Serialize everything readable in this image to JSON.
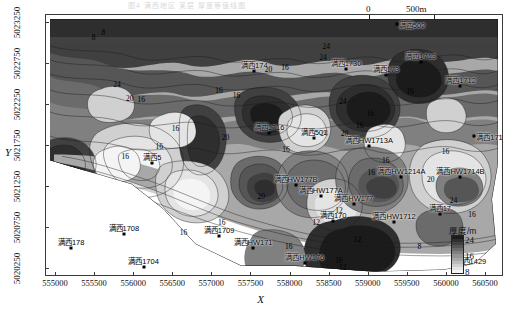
{
  "caption": "图4  满西地区 某层 厚度等值线图",
  "axes": {
    "x_title": "X",
    "y_title": "Y",
    "x_ticks": [
      "555000",
      "555500",
      "556000",
      "556500",
      "557000",
      "557500",
      "558000",
      "558500",
      "559000",
      "559500",
      "560000",
      "560500"
    ],
    "y_ticks": [
      "5020250",
      "5020750",
      "5021250",
      "5021750",
      "5022250",
      "5022750",
      "5023250"
    ]
  },
  "scalebar": {
    "start": "0",
    "end": "500m"
  },
  "legend": {
    "title": "厚度/m",
    "ticks": [
      "24",
      "16",
      "8"
    ],
    "colors": [
      "#1c1c1c",
      "#2e2e2e",
      "#414141",
      "#565656",
      "#6b6b6b",
      "#808080",
      "#949494",
      "#a8a8a8",
      "#bcbcbc",
      "#d0d0d0",
      "#e4e4e4",
      "#f4f4f4"
    ]
  },
  "wells": [
    {
      "label": "满西502",
      "x": 0.766,
      "y": 0.035,
      "anchor": "left"
    },
    {
      "label": "满西1713",
      "x": 0.818,
      "y": 0.18,
      "anchor": "top"
    },
    {
      "label": "满西1712",
      "x": 0.905,
      "y": 0.27,
      "anchor": "top"
    },
    {
      "label": "满西173",
      "x": 0.742,
      "y": 0.23,
      "anchor": "top"
    },
    {
      "label": "满西1715",
      "x": 0.935,
      "y": 0.46,
      "anchor": "left"
    },
    {
      "label": "满西HW1713A",
      "x": 0.705,
      "y": 0.5,
      "anchor": "top"
    },
    {
      "label": "满西174",
      "x": 0.455,
      "y": 0.215,
      "anchor": "top"
    },
    {
      "label": "满西1730",
      "x": 0.655,
      "y": 0.205,
      "anchor": "top"
    },
    {
      "label": "满西1716",
      "x": 0.487,
      "y": 0.45,
      "anchor": "top"
    },
    {
      "label": "满西501",
      "x": 0.585,
      "y": 0.47,
      "anchor": "top"
    },
    {
      "label": "满西5",
      "x": 0.232,
      "y": 0.565,
      "anchor": "top"
    },
    {
      "label": "满西HW177B",
      "x": 0.545,
      "y": 0.65,
      "anchor": "top"
    },
    {
      "label": "满西HW177A",
      "x": 0.6,
      "y": 0.69,
      "anchor": "top"
    },
    {
      "label": "满西HW177",
      "x": 0.672,
      "y": 0.72,
      "anchor": "top"
    },
    {
      "label": "满西170",
      "x": 0.627,
      "y": 0.785,
      "anchor": "top"
    },
    {
      "label": "满西HW1214A",
      "x": 0.776,
      "y": 0.62,
      "anchor": "top"
    },
    {
      "label": "满西HW1714B",
      "x": 0.905,
      "y": 0.62,
      "anchor": "top"
    },
    {
      "label": "满西HW1712",
      "x": 0.76,
      "y": 0.79,
      "anchor": "top"
    },
    {
      "label": "满西17",
      "x": 0.86,
      "y": 0.76,
      "anchor": "top"
    },
    {
      "label": "满西HW176",
      "x": 0.565,
      "y": 0.945,
      "anchor": "top"
    },
    {
      "label": "满西1429",
      "x": 0.89,
      "y": 0.935,
      "anchor": "left"
    },
    {
      "label": "满西HW171",
      "x": 0.452,
      "y": 0.89,
      "anchor": "top"
    },
    {
      "label": "满西1709",
      "x": 0.378,
      "y": 0.845,
      "anchor": "top"
    },
    {
      "label": "满西1708",
      "x": 0.17,
      "y": 0.835,
      "anchor": "top"
    },
    {
      "label": "满西178",
      "x": 0.055,
      "y": 0.89,
      "anchor": "top"
    },
    {
      "label": "满西1704",
      "x": 0.213,
      "y": 0.96,
      "anchor": "top"
    }
  ],
  "contour_labels": [
    {
      "text": "8",
      "x": 0.104,
      "y": 0.085
    },
    {
      "text": "8",
      "x": 0.125,
      "y": 0.065
    },
    {
      "text": "24",
      "x": 0.155,
      "y": 0.265
    },
    {
      "text": "20",
      "x": 0.183,
      "y": 0.315
    },
    {
      "text": "16",
      "x": 0.208,
      "y": 0.32
    },
    {
      "text": "16",
      "x": 0.378,
      "y": 0.285
    },
    {
      "text": "16",
      "x": 0.416,
      "y": 0.305
    },
    {
      "text": "20",
      "x": 0.486,
      "y": 0.205
    },
    {
      "text": "16",
      "x": 0.522,
      "y": 0.2
    },
    {
      "text": "24",
      "x": 0.605,
      "y": 0.16
    },
    {
      "text": "24",
      "x": 0.612,
      "y": 0.12
    },
    {
      "text": "24",
      "x": 0.648,
      "y": 0.33
    },
    {
      "text": "16",
      "x": 0.283,
      "y": 0.43
    },
    {
      "text": "16",
      "x": 0.247,
      "y": 0.5
    },
    {
      "text": "16",
      "x": 0.173,
      "y": 0.54
    },
    {
      "text": "20",
      "x": 0.392,
      "y": 0.465
    },
    {
      "text": "16",
      "x": 0.524,
      "y": 0.51
    },
    {
      "text": "24",
      "x": 0.607,
      "y": 0.45
    },
    {
      "text": "20",
      "x": 0.652,
      "y": 0.45
    },
    {
      "text": "16",
      "x": 0.708,
      "y": 0.375
    },
    {
      "text": "16",
      "x": 0.685,
      "y": 0.42
    },
    {
      "text": "20",
      "x": 0.47,
      "y": 0.69
    },
    {
      "text": "16",
      "x": 0.71,
      "y": 0.6
    },
    {
      "text": "16",
      "x": 0.742,
      "y": 0.555
    },
    {
      "text": "20",
      "x": 0.84,
      "y": 0.625
    },
    {
      "text": "12",
      "x": 0.64,
      "y": 0.745
    },
    {
      "text": "12",
      "x": 0.59,
      "y": 0.79
    },
    {
      "text": "24",
      "x": 0.89,
      "y": 0.705
    },
    {
      "text": "16",
      "x": 0.93,
      "y": 0.76
    },
    {
      "text": "16",
      "x": 0.384,
      "y": 0.79
    },
    {
      "text": "12",
      "x": 0.68,
      "y": 0.855
    },
    {
      "text": "16",
      "x": 0.3,
      "y": 0.83
    },
    {
      "text": "16",
      "x": 0.64,
      "y": 0.935
    },
    {
      "text": "12",
      "x": 0.648,
      "y": 0.96
    },
    {
      "text": "16",
      "x": 0.53,
      "y": 0.88
    },
    {
      "text": "8",
      "x": 0.815,
      "y": 0.88
    },
    {
      "text": "16",
      "x": 0.872,
      "y": 0.52
    },
    {
      "text": "16",
      "x": 0.795,
      "y": 0.29
    }
  ],
  "chart_data": {
    "type": "contour",
    "xlabel": "X",
    "ylabel": "Y",
    "unit": "m",
    "quantity": "厚度",
    "xlim": [
      554750,
      560750
    ],
    "ylim": [
      5020050,
      5023450
    ],
    "contour_levels": [
      8,
      12,
      16,
      20,
      24
    ],
    "colorbar_range": [
      4,
      28
    ],
    "colorbar_ticks": [
      8,
      16,
      24
    ],
    "legend_position": "bottom-right",
    "grid": false,
    "scalebar_meters": 500,
    "n_wells": 26,
    "series": [
      {
        "name": "well thickness control points",
        "points": [
          {
            "name": "满西502",
            "x": 559300,
            "y": 5023300,
            "value": 10
          },
          {
            "name": "满西1713",
            "x": 559650,
            "y": 5022820,
            "value": 14
          },
          {
            "name": "满西1712",
            "x": 560200,
            "y": 5022520,
            "value": 16
          },
          {
            "name": "满西173",
            "x": 559150,
            "y": 5022680,
            "value": 26
          },
          {
            "name": "满西1715",
            "x": 560400,
            "y": 5021900,
            "value": 16
          },
          {
            "name": "满西HW1713A",
            "x": 558950,
            "y": 5021770,
            "value": 16
          },
          {
            "name": "满西174",
            "x": 557450,
            "y": 5022780,
            "value": 17
          },
          {
            "name": "满西1730",
            "x": 558700,
            "y": 5022820,
            "value": 22
          },
          {
            "name": "满西1716",
            "x": 557650,
            "y": 5021990,
            "value": 15
          },
          {
            "name": "满西501",
            "x": 558250,
            "y": 5021920,
            "value": 22
          },
          {
            "name": "满西5",
            "x": 556150,
            "y": 5021600,
            "value": 14
          },
          {
            "name": "满西HW177B",
            "x": 558000,
            "y": 5021320,
            "value": 18
          },
          {
            "name": "满西HW177A",
            "x": 558350,
            "y": 5021190,
            "value": 17
          },
          {
            "name": "满西HW177",
            "x": 558780,
            "y": 5021090,
            "value": 16
          },
          {
            "name": "满西170",
            "x": 558520,
            "y": 5020870,
            "value": 13
          },
          {
            "name": "满西HW1214A",
            "x": 559400,
            "y": 5021420,
            "value": 17
          },
          {
            "name": "满西HW1714B",
            "x": 560180,
            "y": 5021420,
            "value": 18
          },
          {
            "name": "满西HW1712",
            "x": 559300,
            "y": 5020850,
            "value": 12
          },
          {
            "name": "满西17",
            "x": 559900,
            "y": 5020950,
            "value": 22
          },
          {
            "name": "满西HW176",
            "x": 558150,
            "y": 5020340,
            "value": 14
          },
          {
            "name": "满西1429",
            "x": 560100,
            "y": 5020380,
            "value": 9
          },
          {
            "name": "满西HW171",
            "x": 557500,
            "y": 5020520,
            "value": 12
          },
          {
            "name": "满西1709",
            "x": 557050,
            "y": 5020670,
            "value": 12
          },
          {
            "name": "满西1708",
            "x": 555800,
            "y": 5020700,
            "value": 12
          },
          {
            "name": "满西178",
            "x": 555100,
            "y": 5020520,
            "value": 11
          },
          {
            "name": "满西1704",
            "x": 556050,
            "y": 5020280,
            "value": 10
          }
        ]
      }
    ]
  }
}
